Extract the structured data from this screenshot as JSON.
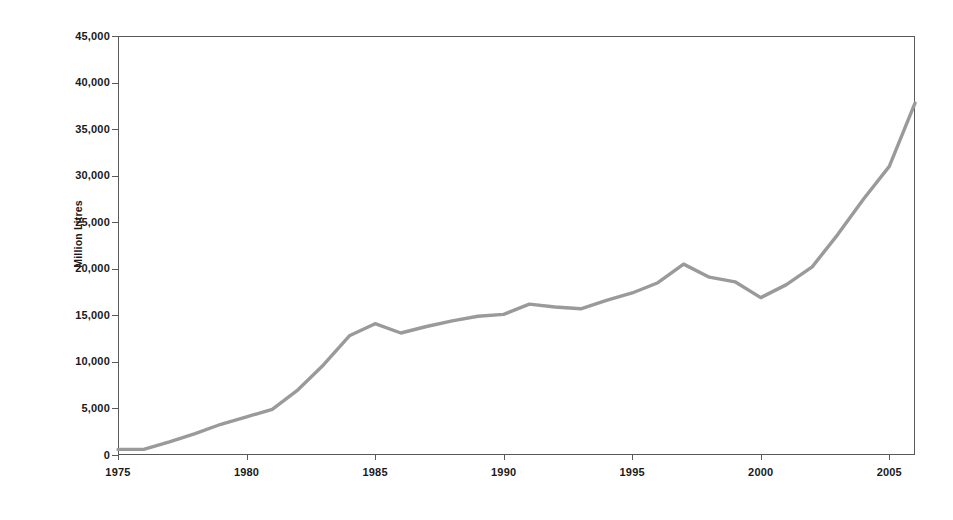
{
  "chart_data": {
    "type": "line",
    "title": "",
    "xlabel": "",
    "ylabel": "Million Litres",
    "xlim": [
      1975,
      2006
    ],
    "ylim": [
      0,
      45000
    ],
    "grid": false,
    "legend": "none",
    "line_color": "#9a9a9a",
    "axis_color": "#58595b",
    "x_tick_labels": [
      "1975",
      "1980",
      "1985",
      "1990",
      "1995",
      "2000",
      "2005"
    ],
    "x_ticks": [
      1975,
      1980,
      1985,
      1990,
      1995,
      2000,
      2005
    ],
    "y_tick_labels": [
      "0",
      "5,000",
      "10,000",
      "15,000",
      "20,000",
      "25,000",
      "30,000",
      "35,000",
      "40,000",
      "45,000"
    ],
    "y_ticks": [
      0,
      5000,
      10000,
      15000,
      20000,
      25000,
      30000,
      35000,
      40000,
      45000
    ],
    "x": [
      1975,
      1976,
      1977,
      1978,
      1979,
      1980,
      1981,
      1982,
      1983,
      1984,
      1985,
      1986,
      1987,
      1988,
      1989,
      1990,
      1991,
      1992,
      1993,
      1994,
      1995,
      1996,
      1997,
      1998,
      1999,
      2000,
      2001,
      2002,
      2003,
      2004,
      2005,
      2006
    ],
    "values": [
      600,
      600,
      1400,
      2300,
      3300,
      4100,
      4900,
      7000,
      9700,
      12800,
      14100,
      13100,
      13800,
      14400,
      14900,
      15100,
      16200,
      15900,
      15700,
      16600,
      17400,
      18500,
      20500,
      19100,
      18600,
      16900,
      18300,
      20200,
      23700,
      27500,
      31000,
      37800
    ],
    "series": [
      {
        "name": "Million Litres",
        "values": [
          600,
          600,
          1400,
          2300,
          3300,
          4100,
          4900,
          7000,
          9700,
          12800,
          14100,
          13100,
          13800,
          14400,
          14900,
          15100,
          16200,
          15900,
          15700,
          16600,
          17400,
          18500,
          20500,
          19100,
          18600,
          16900,
          18300,
          20200,
          23700,
          27500,
          31000,
          37800
        ]
      }
    ]
  }
}
